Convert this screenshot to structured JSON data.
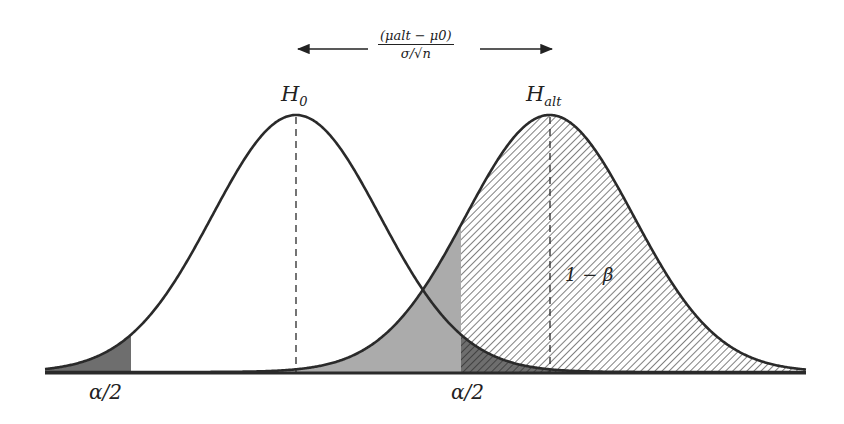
{
  "figure": {
    "labels": {
      "h0": "H",
      "h0_sub": "0",
      "halt": "H",
      "halt_sub": "alt",
      "alpha_left": "α/2",
      "alpha_right": "α/2",
      "power": "1 − β",
      "shift_numerator": "(μalt − μ0)",
      "shift_denominator": "σ/√n"
    },
    "colors": {
      "curve": "#2a2a2a",
      "alpha_fill": "#6e6e6e",
      "beta_fill": "#ababab",
      "hatch": "#3a3a3a",
      "background": "#ffffff"
    }
  },
  "chart_data": {
    "type": "area",
    "title": "",
    "xlabel": "",
    "ylabel": "",
    "grid": false,
    "series": [
      {
        "name": "H0",
        "distribution": "normal",
        "mean": 0,
        "sd": 1
      },
      {
        "name": "H_alt",
        "distribution": "normal",
        "mean": 3.02,
        "sd": 1
      }
    ],
    "critical_values": [
      -1.96,
      1.96
    ],
    "regions": [
      {
        "name": "alpha/2 (left tail of H0)",
        "from": "-inf",
        "to": -1.96,
        "fill": "dark gray"
      },
      {
        "name": "alpha/2 (right tail of H0)",
        "from": 1.96,
        "to": "inf",
        "fill": "dark gray (under hatch)"
      },
      {
        "name": "beta (H_alt below critical value)",
        "from": "-inf",
        "to": 1.96,
        "fill": "light gray"
      },
      {
        "name": "1 - beta (power)",
        "from": 1.96,
        "to": "inf",
        "fill": "hatched"
      }
    ],
    "annotations": [
      "H0",
      "H_alt",
      "α/2",
      "α/2",
      "1 − β",
      "(μ_alt − μ0)/(σ/√n) ↔ distance between means"
    ]
  }
}
